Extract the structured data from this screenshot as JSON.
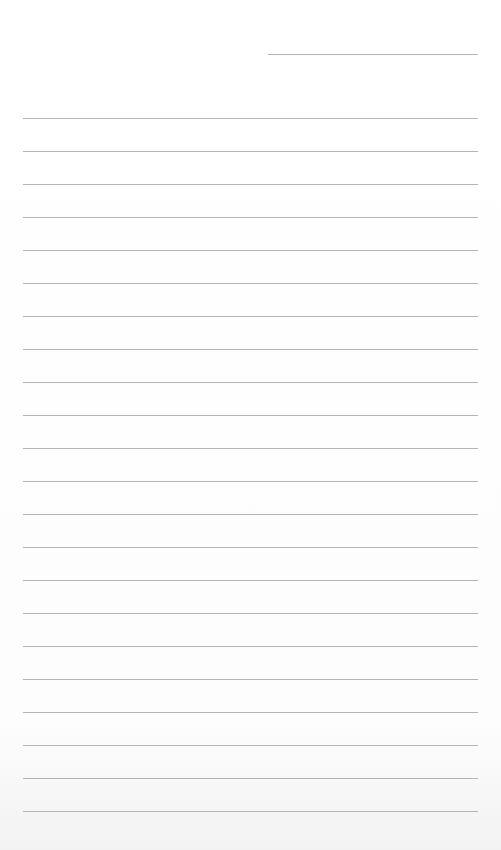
{
  "page": {
    "type": "lined-paper",
    "colors": {
      "paper": "#ffffff",
      "rule": "#b4b4b4"
    },
    "date_line": {
      "top": 54,
      "left": 268,
      "width": 210
    },
    "rules": {
      "first_top": 118,
      "spacing": 33,
      "count": 22,
      "left": 23,
      "width": 455
    }
  }
}
